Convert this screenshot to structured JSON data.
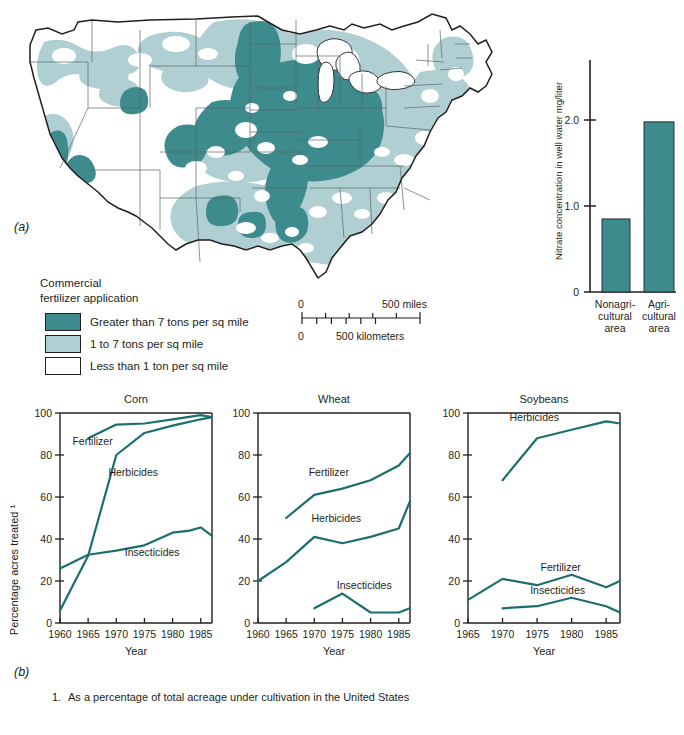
{
  "figure": {
    "panel_a_label": "(a)",
    "panel_b_label": "(b)",
    "footnote_number": "1.",
    "footnote_text": "As a percentage of total acreage under cultivation in the United States"
  },
  "colors": {
    "dark_teal": "#3D8B8D",
    "light_teal": "#AFCFD2",
    "white": "#FFFFFF",
    "line": "#1C6E70",
    "outline": "#231F20",
    "state_line": "#5A6468"
  },
  "map": {
    "legend": {
      "title_line1": "Commercial",
      "title_line2": "fertilizer application",
      "items": [
        {
          "label": "Greater than 7 tons per sq mile",
          "color": "#3D8B8D"
        },
        {
          "label": "1 to 7 tons per sq mile",
          "color": "#AFCFD2"
        },
        {
          "label": "Less than 1 ton per sq mile",
          "color": "#FFFFFF"
        }
      ]
    },
    "scale": {
      "miles_zero": "0",
      "miles_label": "500 miles",
      "km_zero": "0",
      "km_label": "500 kilometers"
    }
  },
  "chart_data": [
    {
      "type": "bar",
      "title": "",
      "ylabel": "Nitrate concentration in well water mg/liter",
      "xlabel": "",
      "categories": [
        "Nonagri-\ncultural\narea",
        "Agri-\ncultural\narea"
      ],
      "category_lines": [
        [
          "Nonagri-",
          "cultural",
          "area"
        ],
        [
          "Agri-",
          "cultural",
          "area"
        ]
      ],
      "values": [
        0.85,
        1.98
      ],
      "ylim": [
        0,
        2.7
      ],
      "yticks": [
        0,
        1.0,
        2.0
      ],
      "ytick_labels": [
        "0",
        "1.0",
        "2.0"
      ],
      "bar_color": "#3D8B8D",
      "grid": false,
      "legend": "none"
    },
    {
      "type": "line",
      "title": "Corn",
      "xlabel": "Year",
      "ylabel": "Percentage acres treated ¹",
      "xlim": [
        1960,
        1987
      ],
      "ylim": [
        0,
        100
      ],
      "xticks": [
        1960,
        1965,
        1970,
        1975,
        1980,
        1985
      ],
      "xtick_labels": [
        "1960",
        "1965",
        "1970",
        "1975",
        "1980",
        "1985"
      ],
      "yticks": [
        0,
        20,
        40,
        60,
        80,
        100
      ],
      "ytick_labels": [
        "0",
        "20",
        "40",
        "60",
        "80",
        "100"
      ],
      "grid": false,
      "legend": "inline-labels",
      "series": [
        {
          "name": "Fertilizer",
          "x": [
            1965,
            1970,
            1975,
            1980,
            1985,
            1987
          ],
          "values": [
            88,
            94.5,
            95,
            97,
            99,
            98
          ]
        },
        {
          "name": "Herbicides",
          "x": [
            1960,
            1965,
            1970,
            1975,
            1980,
            1985,
            1987
          ],
          "values": [
            6,
            32,
            80,
            90.5,
            94,
            97,
            98
          ]
        },
        {
          "name": "Insecticides",
          "x": [
            1960,
            1965,
            1970,
            1975,
            1980,
            1983,
            1985,
            1987
          ],
          "values": [
            26,
            32.5,
            34.5,
            37,
            43,
            44,
            45.5,
            41.5
          ]
        }
      ],
      "label_positions": [
        {
          "name": "Fertilizer",
          "x": 1962.2,
          "y": 85
        },
        {
          "name": "Herbicides",
          "x": 1968.6,
          "y": 70
        },
        {
          "name": "Insecticides",
          "x": 1971.5,
          "y": 32
        }
      ]
    },
    {
      "type": "line",
      "title": "Wheat",
      "xlabel": "Year",
      "ylabel": "",
      "xlim": [
        1960,
        1987
      ],
      "ylim": [
        0,
        100
      ],
      "xticks": [
        1960,
        1965,
        1970,
        1975,
        1980,
        1985
      ],
      "xtick_labels": [
        "1960",
        "1965",
        "1970",
        "1975",
        "1980",
        "1985"
      ],
      "yticks": [
        0,
        20,
        40,
        60,
        80,
        100
      ],
      "ytick_labels": [
        "0",
        "20",
        "40",
        "60",
        "80",
        "100"
      ],
      "grid": false,
      "legend": "inline-labels",
      "series": [
        {
          "name": "Fertilizer",
          "x": [
            1965,
            1970,
            1975,
            1980,
            1985,
            1987
          ],
          "values": [
            50,
            61,
            64,
            68,
            75,
            81
          ]
        },
        {
          "name": "Herbicides",
          "x": [
            1960,
            1965,
            1970,
            1975,
            1980,
            1985,
            1987
          ],
          "values": [
            20,
            29,
            41,
            38,
            41,
            45,
            58
          ]
        },
        {
          "name": "Insecticides",
          "x": [
            1970,
            1975,
            1980,
            1985,
            1987
          ],
          "values": [
            7,
            14,
            5,
            5,
            7
          ]
        }
      ],
      "label_positions": [
        {
          "name": "Fertilizer",
          "x": 1969.0,
          "y": 70
        },
        {
          "name": "Herbicides",
          "x": 1969.5,
          "y": 48
        },
        {
          "name": "Insecticides",
          "x": 1974.0,
          "y": 16
        }
      ]
    },
    {
      "type": "line",
      "title": "Soybeans",
      "xlabel": "Year",
      "ylabel": "",
      "xlim": [
        1965,
        1987
      ],
      "ylim": [
        0,
        100
      ],
      "xticks": [
        1965,
        1970,
        1975,
        1980,
        1985
      ],
      "xtick_labels": [
        "1965",
        "1970",
        "1975",
        "1980",
        "1985"
      ],
      "yticks": [
        0,
        20,
        40,
        60,
        80,
        100
      ],
      "ytick_labels": [
        "0",
        "20",
        "40",
        "60",
        "80",
        "100"
      ],
      "grid": false,
      "legend": "inline-labels",
      "series": [
        {
          "name": "Herbicides",
          "x": [
            1970,
            1975,
            1980,
            1985,
            1987
          ],
          "values": [
            68,
            88,
            92,
            96,
            95
          ]
        },
        {
          "name": "Fertilizer",
          "x": [
            1965,
            1970,
            1975,
            1980,
            1985,
            1987
          ],
          "values": [
            11,
            21,
            18,
            23,
            17,
            20
          ]
        },
        {
          "name": "Insecticides",
          "x": [
            1970,
            1975,
            1980,
            1985,
            1987
          ],
          "values": [
            7,
            8,
            12,
            8,
            5
          ]
        }
      ],
      "label_positions": [
        {
          "name": "Herbicides",
          "x": 1971.0,
          "y": 96
        },
        {
          "name": "Fertilizer",
          "x": 1975.5,
          "y": 25
        },
        {
          "name": "Insecticides",
          "x": 1974.0,
          "y": 14
        }
      ]
    }
  ]
}
